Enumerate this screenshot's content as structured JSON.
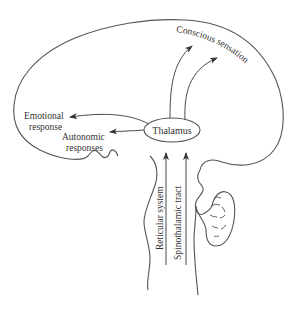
{
  "diagram": {
    "title": "",
    "nodes": {
      "thalamus": {
        "label": "Thalamus"
      }
    },
    "labels": {
      "conscious_sensation": "Conscious sensation",
      "emotional_response_line1": "Emotional",
      "emotional_response_line2": "response",
      "autonomic_responses_line1": "Autonomic",
      "autonomic_responses_line2": "responses",
      "reticular_system": "Reticular system",
      "spinothalamic_tract": "Spinothalamic tract"
    },
    "edges": [
      {
        "from": "Reticular system",
        "to": "Thalamus"
      },
      {
        "from": "Spinothalamic tract",
        "to": "Thalamus"
      },
      {
        "from": "Thalamus",
        "to": "Conscious sensation"
      },
      {
        "from": "Thalamus",
        "to": "Conscious sensation"
      },
      {
        "from": "Thalamus",
        "to": "Emotional response"
      },
      {
        "from": "Thalamus",
        "to": "Autonomic responses"
      }
    ],
    "colors": {
      "stroke": "#555555",
      "text": "#333333",
      "background": "#ffffff"
    }
  }
}
